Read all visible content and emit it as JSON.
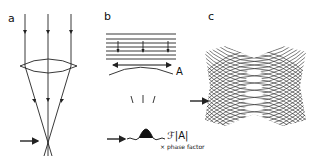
{
  "figure": {
    "panels": [
      {
        "id": "a",
        "label": "a",
        "description": "Converging lens focusing parallel rays to a focal point"
      },
      {
        "id": "b",
        "label": "b",
        "description": "Plane wavefronts through aperture A with its Fourier transform",
        "aperture_label": "A",
        "transform_label": "ℱ|A|",
        "transform_note": "× phase factor"
      },
      {
        "id": "c",
        "label": "c",
        "description": "Interference pattern of converging spherical waves near focus"
      }
    ],
    "icons": {
      "focus_arrow": "right-arrow",
      "ray_arrow": "down-arrow"
    }
  }
}
